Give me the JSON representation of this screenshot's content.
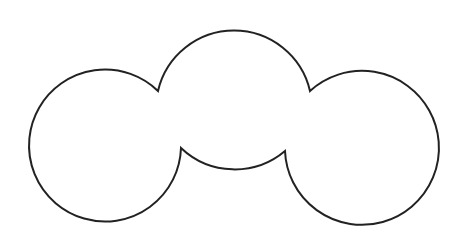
{
  "diagram": {
    "shape": "cloud-outline",
    "stroke_color": "#222222",
    "fill_color": "#ffffff",
    "background": "#ffffff",
    "circles": [
      {
        "name": "left",
        "cx": 107,
        "cy": 149,
        "r": 76
      },
      {
        "name": "middle",
        "cx": 233,
        "cy": 91,
        "r": 78
      },
      {
        "name": "right",
        "cx": 360,
        "cy": 150,
        "r": 77
      }
    ],
    "cusps": {
      "top_left": [
        158,
        91
      ],
      "top_right": [
        310,
        91
      ],
      "bottom_left": [
        181,
        148
      ],
      "bottom_right": [
        285,
        151
      ]
    }
  }
}
